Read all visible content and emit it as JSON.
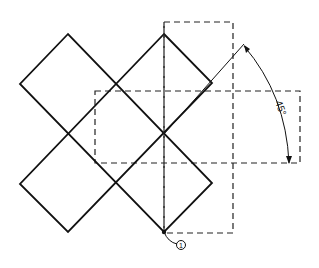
{
  "diagram": {
    "angle_label": "45°",
    "point_label": "1",
    "colors": {
      "line": "#111111",
      "background": "#ffffff"
    }
  },
  "geometry": {
    "dashed_vertical_rect": {
      "x": 164,
      "y": 22,
      "w": 69,
      "h": 211
    },
    "dashed_horizontal_rect": {
      "x": 95,
      "y": 91,
      "w": 205,
      "h": 72
    },
    "solid_cross_outline": [
      [
        68,
        34
      ],
      [
        115,
        83
      ],
      [
        164,
        34
      ],
      [
        212,
        83
      ],
      [
        164,
        133
      ],
      [
        212,
        183
      ],
      [
        164,
        232
      ],
      [
        115,
        183
      ],
      [
        68,
        232
      ],
      [
        20,
        184
      ],
      [
        68,
        134
      ],
      [
        20,
        84
      ]
    ],
    "rotation_line": {
      "from": [
        164,
        232
      ],
      "to": [
        244,
        44
      ]
    },
    "pivot_point": [
      164,
      232
    ]
  }
}
